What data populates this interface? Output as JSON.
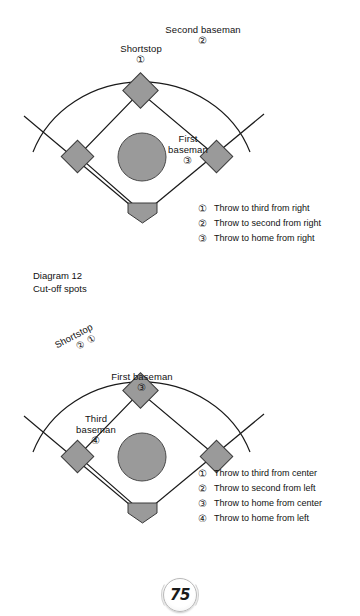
{
  "page": {
    "number": "75",
    "caption_title": "Diagram 12",
    "caption_subtitle": "Cut-off spots"
  },
  "diagrams": [
    {
      "id": "top",
      "field_labels": [
        {
          "name": "second-baseman",
          "text": "Second baseman",
          "num": "②"
        },
        {
          "name": "shortstop",
          "text": "Shortstop",
          "num": "①"
        },
        {
          "name": "first-baseman",
          "text_line1": "First",
          "text_line2": "baseman",
          "num": "③"
        }
      ],
      "legend": [
        {
          "num": "①",
          "text": "Throw to third from right"
        },
        {
          "num": "②",
          "text": "Throw to second from right"
        },
        {
          "num": "③",
          "text": "Throw to home from right"
        }
      ]
    },
    {
      "id": "bottom",
      "field_labels": [
        {
          "name": "shortstop",
          "text": "Shortstop",
          "num1": "②",
          "num2": "①"
        },
        {
          "name": "first-baseman",
          "text": "First baseman",
          "num": "③"
        },
        {
          "name": "third-baseman",
          "text_line1": "Third",
          "text_line2": "baseman",
          "num": "④"
        }
      ],
      "legend": [
        {
          "num": "①",
          "text": "Throw to third from center"
        },
        {
          "num": "②",
          "text": "Throw to second from left"
        },
        {
          "num": "③",
          "text": "Throw to home from center"
        },
        {
          "num": "④",
          "text": "Throw to home from left"
        }
      ]
    }
  ],
  "colors": {
    "base_fill": "#9a9a9a",
    "mound_fill": "#9a9a9a",
    "line": "#1a1a1a",
    "text": "#111111"
  }
}
